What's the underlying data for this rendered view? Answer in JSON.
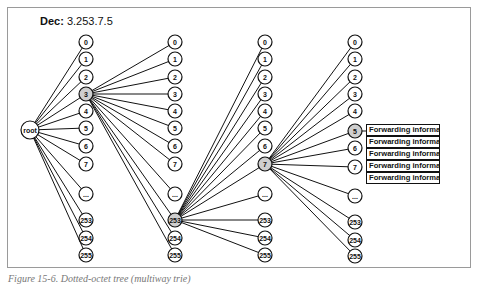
{
  "title": {
    "label": "Dec:",
    "value": "3.253.7.5"
  },
  "root": {
    "label": "root",
    "x": 30,
    "y": 130
  },
  "columns": [
    {
      "x": 86,
      "highlighted": "3",
      "nodes": [
        {
          "label": "0",
          "y": 42
        },
        {
          "label": "1",
          "y": 59
        },
        {
          "label": "2",
          "y": 77
        },
        {
          "label": "3",
          "y": 94
        },
        {
          "label": "4",
          "y": 111
        },
        {
          "label": "5",
          "y": 128
        },
        {
          "label": "6",
          "y": 146
        },
        {
          "label": "7",
          "y": 164
        },
        {
          "label": "...",
          "y": 194
        },
        {
          "label": "253",
          "y": 220
        },
        {
          "label": "254",
          "y": 238
        },
        {
          "label": "255",
          "y": 255
        }
      ]
    },
    {
      "x": 175,
      "highlighted": "253",
      "nodes": [
        {
          "label": "0",
          "y": 42
        },
        {
          "label": "1",
          "y": 59
        },
        {
          "label": "2",
          "y": 77
        },
        {
          "label": "3",
          "y": 94
        },
        {
          "label": "4",
          "y": 111
        },
        {
          "label": "5",
          "y": 128
        },
        {
          "label": "6",
          "y": 146
        },
        {
          "label": "7",
          "y": 164
        },
        {
          "label": "...",
          "y": 194
        },
        {
          "label": "253",
          "y": 220
        },
        {
          "label": "254",
          "y": 238
        },
        {
          "label": "255",
          "y": 255
        }
      ]
    },
    {
      "x": 265,
      "highlighted": "7",
      "nodes": [
        {
          "label": "0",
          "y": 42
        },
        {
          "label": "1",
          "y": 59
        },
        {
          "label": "2",
          "y": 77
        },
        {
          "label": "3",
          "y": 94
        },
        {
          "label": "4",
          "y": 111
        },
        {
          "label": "5",
          "y": 128
        },
        {
          "label": "6",
          "y": 146
        },
        {
          "label": "7",
          "y": 164
        },
        {
          "label": "...",
          "y": 194
        },
        {
          "label": "253",
          "y": 220
        },
        {
          "label": "254",
          "y": 238
        },
        {
          "label": "255",
          "y": 255
        }
      ]
    },
    {
      "x": 355,
      "highlighted": "5",
      "nodes": [
        {
          "label": "0",
          "y": 42
        },
        {
          "label": "1",
          "y": 59
        },
        {
          "label": "2",
          "y": 77
        },
        {
          "label": "3",
          "y": 94
        },
        {
          "label": "4",
          "y": 111
        },
        {
          "label": "5",
          "y": 131
        },
        {
          "label": "6",
          "y": 148
        },
        {
          "label": "7",
          "y": 167
        },
        {
          "label": "...",
          "y": 196
        },
        {
          "label": "253",
          "y": 222
        },
        {
          "label": "254",
          "y": 240
        },
        {
          "label": "255",
          "y": 256
        }
      ]
    }
  ],
  "forwarding": {
    "rows": [
      {
        "label": "Forwarding information",
        "top": 124
      },
      {
        "label": "Forwarding information",
        "top": 136
      },
      {
        "label": "Forwarding information",
        "top": 148
      },
      {
        "label": "Forwarding information",
        "top": 160
      },
      {
        "label": "Forwarding information",
        "top": 172
      }
    ]
  },
  "colors": {
    "line": "#111111",
    "node_fill": "#ffffff",
    "highlight_fill": "#cfcfcf",
    "frame": "#9a9a9a"
  },
  "caption": "Figure 15-6. Dotted-octet tree (multiway trie)"
}
